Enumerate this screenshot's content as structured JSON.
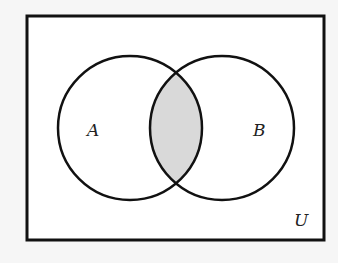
{
  "diagram": {
    "type": "venn",
    "universe_label": "U",
    "sets": [
      {
        "label": "A",
        "cx": 130,
        "cy": 128,
        "r": 72
      },
      {
        "label": "B",
        "cx": 222,
        "cy": 128,
        "r": 72
      }
    ],
    "shaded_region": "A ∩ B",
    "colors": {
      "background": "#f6f6f6",
      "box_fill": "#ffffff",
      "stroke": "#111111",
      "shade": "#d9d9d9"
    }
  }
}
